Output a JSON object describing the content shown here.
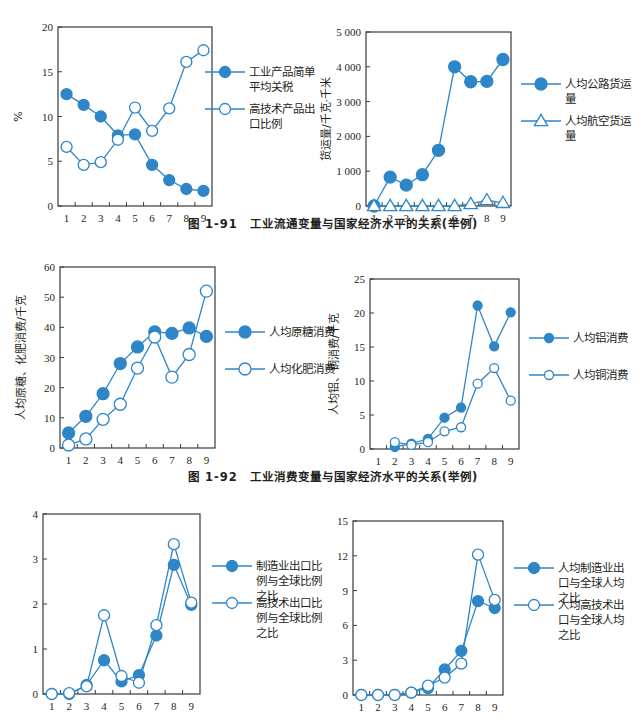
{
  "figures": [
    {
      "id": "fig-1-91",
      "caption": "图 1-91　工业流通变量与国家经济水平的关系(举例)"
    },
    {
      "id": "fig-1-92",
      "caption": "图 1-92　工业消费变量与国家经济水平的关系(举例)"
    }
  ],
  "colors": {
    "series": "#2e86c8",
    "axis": "#231f20",
    "marker_fill": "#2e86c8",
    "marker_open": "#ffffff"
  },
  "chart_data": [
    {
      "id": "tariff-hightech",
      "type": "line",
      "title": "",
      "xlabel": "",
      "ylabel": "%",
      "x": [
        1,
        2,
        3,
        4,
        5,
        6,
        7,
        8,
        9
      ],
      "ylim": [
        0,
        20
      ],
      "yticks": [
        0,
        5,
        10,
        15,
        20
      ],
      "ytick_labels": [
        "0",
        "5",
        "10",
        "15",
        "20"
      ],
      "grid": false,
      "legend_position": "right",
      "series": [
        {
          "name": "工业产品简单平均关税",
          "legend_lines": [
            "工业产品简单",
            "平均关税"
          ],
          "marker": "filled-circle",
          "values": [
            12.5,
            11.3,
            10.0,
            7.9,
            8.0,
            4.6,
            2.9,
            1.9,
            1.7
          ]
        },
        {
          "name": "高技术产品出口比例",
          "legend_lines": [
            "高技术产品出",
            "口比例"
          ],
          "marker": "open-circle",
          "values": [
            6.6,
            4.6,
            4.9,
            7.4,
            11.0,
            8.4,
            10.9,
            16.1,
            17.4
          ]
        }
      ]
    },
    {
      "id": "freight",
      "type": "line",
      "title": "",
      "xlabel": "",
      "ylabel": "货运量/千克·千米",
      "x": [
        1,
        2,
        3,
        4,
        5,
        6,
        7,
        8,
        9
      ],
      "ylim": [
        0,
        5000
      ],
      "yticks": [
        0,
        1000,
        2000,
        3000,
        4000,
        5000
      ],
      "ytick_labels": [
        "0",
        "1 000",
        "2 000",
        "3 000",
        "4 000",
        "5 000"
      ],
      "grid": false,
      "legend_position": "right",
      "series": [
        {
          "name": "人均公路货运量",
          "legend_lines": [
            "人均公路货运",
            "量"
          ],
          "marker": "filled-circle",
          "values": [
            0,
            830,
            600,
            900,
            1600,
            4000,
            3570,
            3580,
            4210
          ]
        },
        {
          "name": "人均航空货运量",
          "legend_lines": [
            "人均航空货运",
            "量"
          ],
          "marker": "open-triangle",
          "values": [
            0,
            0,
            0,
            0,
            0,
            0,
            60,
            170,
            90
          ]
        }
      ]
    },
    {
      "id": "sugar-fertilizer",
      "type": "line",
      "title": "",
      "xlabel": "",
      "ylabel": "人均原糖、化肥消费/千克",
      "x": [
        1,
        2,
        3,
        4,
        5,
        6,
        7,
        8,
        9
      ],
      "ylim": [
        0,
        60
      ],
      "yticks": [
        0,
        10,
        20,
        30,
        40,
        50,
        60
      ],
      "ytick_labels": [
        "0",
        "10",
        "20",
        "30",
        "40",
        "50",
        "60"
      ],
      "grid": false,
      "legend_position": "right",
      "series": [
        {
          "name": "人均原糖消费",
          "legend_lines": [
            "人均原糖消费"
          ],
          "marker": "filled-circle",
          "values": [
            5,
            10.5,
            18,
            28,
            33.5,
            38.5,
            38,
            39.8,
            37
          ]
        },
        {
          "name": "人均化肥消费",
          "legend_lines": [
            "人均化肥消费"
          ],
          "marker": "open-circle",
          "values": [
            1,
            3,
            9.5,
            14.5,
            26.5,
            36.8,
            23.5,
            31,
            52
          ]
        }
      ]
    },
    {
      "id": "aluminum-copper",
      "type": "line",
      "title": "",
      "xlabel": "",
      "ylabel": "人均铝、铜消费/千克",
      "x": [
        1,
        2,
        3,
        4,
        5,
        6,
        7,
        8,
        9
      ],
      "ylim": [
        0,
        25
      ],
      "yticks": [
        0,
        5,
        10,
        15,
        20,
        25
      ],
      "ytick_labels": [
        "0",
        "5",
        "10",
        "15",
        "20",
        "25"
      ],
      "grid": false,
      "legend_position": "right",
      "series": [
        {
          "name": "人均铝消费",
          "legend_lines": [
            "人均铝消费"
          ],
          "marker": "filled-circle-small",
          "values": [
            null,
            0.3,
            0.8,
            1.5,
            4.6,
            6.1,
            21.1,
            15.1,
            20.1
          ]
        },
        {
          "name": "人均铜消费",
          "legend_lines": [
            "人均铜消费"
          ],
          "marker": "open-circle-small",
          "values": [
            null,
            1.0,
            0.6,
            1.0,
            2.6,
            3.2,
            9.6,
            11.9,
            7.1
          ]
        }
      ]
    },
    {
      "id": "export-share-ratio",
      "type": "line",
      "title": "",
      "xlabel": "",
      "ylabel": "",
      "x": [
        1,
        2,
        3,
        4,
        5,
        6,
        7,
        8,
        9
      ],
      "ylim": [
        0,
        4
      ],
      "yticks": [
        0,
        1,
        2,
        3,
        4
      ],
      "ytick_labels": [
        "0",
        "1",
        "2",
        "3",
        "4"
      ],
      "grid": false,
      "legend_position": "right",
      "series": [
        {
          "name": "制造业出口比例与全球比例之比",
          "legend_lines": [
            "制造业出口比",
            "例与全球比例",
            "之比"
          ],
          "marker": "filled-circle",
          "values": [
            0,
            0,
            0.2,
            0.75,
            0.28,
            0.42,
            1.3,
            2.87,
            1.98
          ]
        },
        {
          "name": "高技术出口比例与全球比例之比",
          "legend_lines": [
            "高技术出口比",
            "例与全球比例",
            "之比"
          ],
          "marker": "open-circle",
          "values": [
            0,
            0.02,
            0.17,
            1.75,
            0.4,
            0.25,
            1.53,
            3.33,
            2.03
          ]
        }
      ]
    },
    {
      "id": "per-capita-export-ratio",
      "type": "line",
      "title": "",
      "xlabel": "",
      "ylabel": "",
      "x": [
        1,
        2,
        3,
        4,
        5,
        6,
        7,
        8,
        9
      ],
      "ylim": [
        0,
        15
      ],
      "yticks": [
        0,
        3,
        6,
        9,
        12,
        15
      ],
      "ytick_labels": [
        "0",
        "3",
        "6",
        "9",
        "12",
        "15"
      ],
      "grid": false,
      "legend_position": "right",
      "series": [
        {
          "name": "人均制造业出口与全球人均之比",
          "legend_lines": [
            "人均制造业出",
            "口与全球人均",
            "之比"
          ],
          "marker": "filled-circle",
          "values": [
            0,
            0,
            0,
            0.2,
            0.6,
            2.2,
            3.8,
            8.1,
            7.5
          ]
        },
        {
          "name": "人均高技术出口与全球人均之比",
          "legend_lines": [
            "人均高技术出",
            "口与全球人均",
            "之比"
          ],
          "marker": "open-circle",
          "values": [
            0,
            0,
            0,
            0.2,
            0.8,
            1.5,
            2.7,
            12.1,
            8.2
          ]
        }
      ]
    }
  ]
}
